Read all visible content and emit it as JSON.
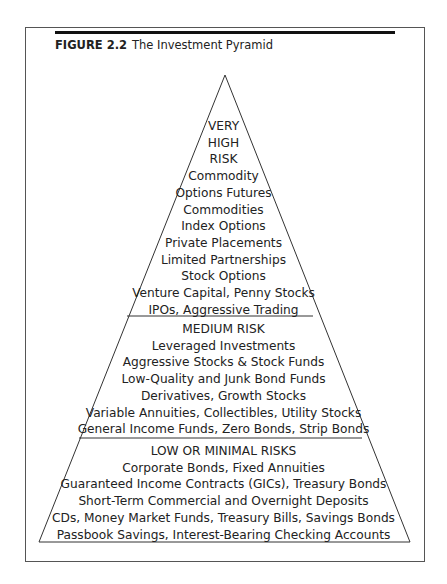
{
  "figure": {
    "number": "FIGURE 2.2",
    "title": "The Investment Pyramid"
  },
  "pyramid": {
    "tiers": [
      {
        "name": "very-high-risk",
        "lines": [
          "VERY",
          "HIGH",
          "RISK",
          "Commodity",
          "Options Futures",
          "Commodities",
          "Index Options",
          "Private Placements",
          "Limited Partnerships",
          "Stock Options",
          "Venture Capital, Penny Stocks",
          "IPOs, Aggressive Trading"
        ]
      },
      {
        "name": "medium-risk",
        "lines": [
          "MEDIUM RISK",
          "Leveraged Investments",
          "Aggressive Stocks & Stock Funds",
          "Low-Quality and Junk Bond Funds",
          "Derivatives, Growth Stocks",
          "Variable Annuities, Collectibles, Utility Stocks",
          "General Income Funds, Zero Bonds, Strip Bonds"
        ]
      },
      {
        "name": "low-or-minimal-risks",
        "lines": [
          "LOW OR MINIMAL RISKS",
          "Corporate Bonds, Fixed Annuities",
          "Guaranteed Income Contracts (GICs), Treasury Bonds",
          "Short-Term Commercial and Overnight Deposits",
          "CDs, Money Market Funds, Treasury Bills, Savings Bonds",
          "Passbook Savings, Interest-Bearing Checking Accounts"
        ]
      }
    ]
  }
}
